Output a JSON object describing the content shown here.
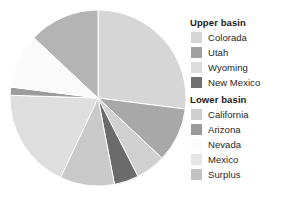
{
  "chart_data": {
    "type": "pie",
    "title": "",
    "legend_position": "right",
    "center": {
      "cx": 90,
      "cy": 90,
      "r": 88
    },
    "start_angle_deg": 0,
    "direction": "clockwise",
    "categories": [
      "Colorada",
      "Utah",
      "Wyoming",
      "New Mexico",
      "California",
      "Arizona",
      "Nevada",
      "Mexico",
      "Surplus"
    ],
    "values": [
      27.0,
      10.0,
      5.5,
      4.5,
      10.0,
      18.5,
      1.5,
      10.0,
      13.0
    ],
    "slices": [
      {
        "label": "Colorada",
        "group": "Upper basin",
        "value": 27.0,
        "color": "#d6d6d6",
        "start_deg": 0.0,
        "end_deg": 97.2
      },
      {
        "label": "Utah",
        "group": "Upper basin",
        "value": 10.0,
        "color": "#a8a8a8",
        "start_deg": 97.2,
        "end_deg": 133.2
      },
      {
        "label": "Wyoming",
        "group": "Upper basin",
        "value": 5.5,
        "color": "#d0d0d0",
        "start_deg": 133.2,
        "end_deg": 153.0
      },
      {
        "label": "New Mexico",
        "group": "Upper basin",
        "value": 4.5,
        "color": "#6b6b6b",
        "start_deg": 153.0,
        "end_deg": 169.2
      },
      {
        "label": "California",
        "group": "Lower basin",
        "value": 10.0,
        "color": "#c9c9c9",
        "start_deg": 169.2,
        "end_deg": 205.2
      },
      {
        "label": "Arizona",
        "group": "Lower basin",
        "value": 18.5,
        "color": "#dedede",
        "start_deg": 205.2,
        "end_deg": 271.8
      },
      {
        "label": "Nevada",
        "group": "Lower basin",
        "value": 1.5,
        "color": "#9c9c9c",
        "start_deg": 271.8,
        "end_deg": 277.2
      },
      {
        "label": "Mexico",
        "group": "Lower basin",
        "value": 10.0,
        "color": "#fafafa",
        "start_deg": 277.2,
        "end_deg": 313.2
      },
      {
        "label": "Surplus",
        "group": "Lower basin",
        "value": 13.0,
        "color": "#b4b4b4",
        "start_deg": 313.2,
        "end_deg": 360.0
      }
    ]
  },
  "legend": {
    "groups": [
      {
        "title": "Upper basin",
        "items": [
          {
            "label": "Colorada",
            "color": "#d6d6d6"
          },
          {
            "label": "Utah",
            "color": "#a0a0a0"
          },
          {
            "label": "Wyoming",
            "color": "#dcdcdc"
          },
          {
            "label": "New Mexico",
            "color": "#707070"
          }
        ]
      },
      {
        "title": "Lower basin",
        "items": [
          {
            "label": "California",
            "color": "#cfcfcf"
          },
          {
            "label": "Arizona",
            "color": "#9a9a9a"
          },
          {
            "label": "Nevada",
            "color": "#fbfbfb"
          },
          {
            "label": "Mexico",
            "color": "#e6e6e6"
          },
          {
            "label": "Surplus",
            "color": "#c2c2c2"
          }
        ]
      }
    ]
  },
  "colors": {
    "background": "#ffffff",
    "text": "#262626",
    "title_text": "#1a1a1a",
    "slice_gap": "#ffffff"
  }
}
